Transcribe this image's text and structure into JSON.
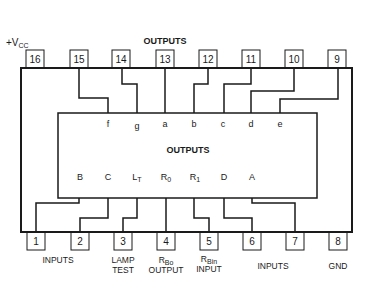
{
  "diagram": {
    "title_top": "OUTPUTS",
    "inner_title": "OUTPUTS",
    "vcc_label": "+V",
    "vcc_sub": "CC",
    "top_pins": [
      {
        "num": "16",
        "signal": ""
      },
      {
        "num": "15",
        "signal": "f"
      },
      {
        "num": "14",
        "signal": "g"
      },
      {
        "num": "13",
        "signal": "a"
      },
      {
        "num": "12",
        "signal": "b"
      },
      {
        "num": "11",
        "signal": "c"
      },
      {
        "num": "10",
        "signal": "d"
      },
      {
        "num": "9",
        "signal": "e"
      }
    ],
    "bottom_pins": [
      {
        "num": "1",
        "signal": "B"
      },
      {
        "num": "2",
        "signal": "C"
      },
      {
        "num": "3",
        "signal": "L",
        "sub": "T"
      },
      {
        "num": "4",
        "signal": "R",
        "sub": "0"
      },
      {
        "num": "5",
        "signal": "R",
        "sub": "1"
      },
      {
        "num": "6",
        "signal": "D"
      },
      {
        "num": "7",
        "signal": "A"
      },
      {
        "num": "8",
        "signal": ""
      }
    ],
    "bottom_captions": {
      "inputs_left": "INPUTS",
      "lamp_test_1": "LAMP",
      "lamp_test_2": "TEST",
      "rbo_main": "R",
      "rbo_sub": "Bo",
      "rbo_line2": "OUTPUT",
      "rbi_main": "R",
      "rbi_sub": "Bin",
      "rbi_line2": "INPUT",
      "inputs_right": "INPUTS",
      "gnd": "GND"
    },
    "inner_signals_top": [
      "f",
      "g",
      "a",
      "b",
      "c",
      "d",
      "e"
    ],
    "inner_signals_bottom": {
      "B": "B",
      "C": "C",
      "LT": "L",
      "LT_sub": "T",
      "R0": "R",
      "R0_sub": "0",
      "R1": "R",
      "R1_sub": "1",
      "D": "D",
      "A": "A"
    }
  }
}
